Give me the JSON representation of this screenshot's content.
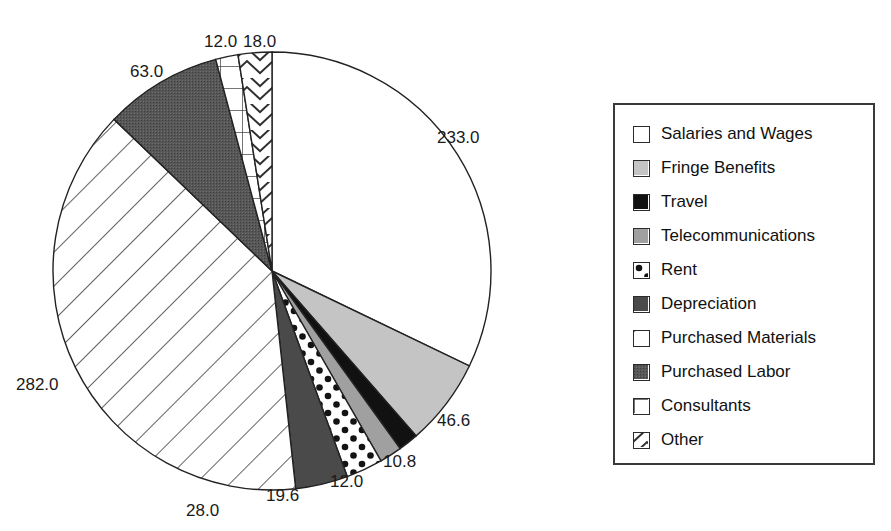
{
  "chart_data": {
    "type": "pie",
    "title": "",
    "subtitle": "",
    "xlabel": "",
    "ylabel": "",
    "legend_position": "right",
    "grid": false,
    "total": 725.0,
    "start_angle_deg": 0,
    "direction": "clockwise",
    "categories": [
      "Salaries and Wages",
      "Fringe Benefits",
      "Travel",
      "Telecommunications",
      "Rent",
      "Depreciation",
      "Purchased Materials",
      "Purchased Labor",
      "Consultants",
      "Other"
    ],
    "values": [
      233.0,
      46.6,
      10.8,
      12.0,
      19.6,
      28.0,
      282.0,
      63.0,
      12.0,
      18.0
    ],
    "data_labels": [
      "233.0",
      "46.6",
      "10.8",
      "12.0",
      "19.6",
      "28.0",
      "282.0",
      "63.0",
      "12.0",
      "18.0"
    ],
    "slices": [
      {
        "label": "Salaries and Wages",
        "value": 233.0,
        "data_label": "233.0",
        "fill": "white",
        "color": "#ffffff"
      },
      {
        "label": "Fringe Benefits",
        "value": 46.6,
        "data_label": "46.6",
        "fill": "light-gray",
        "color": "#c4c4c4"
      },
      {
        "label": "Travel",
        "value": 10.8,
        "data_label": "10.8",
        "fill": "black",
        "color": "#111111"
      },
      {
        "label": "Telecommunications",
        "value": 12.0,
        "data_label": "12.0",
        "fill": "medium-gray",
        "color": "#a0a0a0"
      },
      {
        "label": "Rent",
        "value": 19.6,
        "data_label": "19.6",
        "fill": "dots",
        "color": "#ffffff"
      },
      {
        "label": "Depreciation",
        "value": 28.0,
        "data_label": "28.0",
        "fill": "dark-gray",
        "color": "#4a4a4a"
      },
      {
        "label": "Purchased Materials",
        "value": 282.0,
        "data_label": "282.0",
        "fill": "diagonal-hatch",
        "color": "#ffffff"
      },
      {
        "label": "Purchased Labor",
        "value": 63.0,
        "data_label": "63.0",
        "fill": "stipple-dark",
        "color": "#555555"
      },
      {
        "label": "Consultants",
        "value": 12.0,
        "data_label": "12.0",
        "fill": "grid",
        "color": "#ffffff"
      },
      {
        "label": "Other",
        "value": 18.0,
        "data_label": "18.0",
        "fill": "chevron",
        "color": "#ffffff"
      }
    ]
  },
  "legend": {
    "items": [
      {
        "label": "Salaries and Wages",
        "fill": "white"
      },
      {
        "label": "Fringe Benefits",
        "fill": "light-gray"
      },
      {
        "label": "Travel",
        "fill": "black"
      },
      {
        "label": "Telecommunications",
        "fill": "medium-gray"
      },
      {
        "label": "Rent",
        "fill": "dots"
      },
      {
        "label": "Depreciation",
        "fill": "dark-gray"
      },
      {
        "label": "Purchased Materials",
        "fill": "diagonal-hatch"
      },
      {
        "label": "Purchased Labor",
        "fill": "stipple-dark"
      },
      {
        "label": "Consultants",
        "fill": "grid"
      },
      {
        "label": "Other",
        "fill": "chevron"
      }
    ]
  },
  "geometry": {
    "center_x": 272,
    "center_y": 271,
    "radius": 219
  },
  "labels": [
    {
      "text": "233.0",
      "x": 437,
      "y": 128
    },
    {
      "text": "46.6",
      "x": 437,
      "y": 411
    },
    {
      "text": "10.8",
      "x": 383,
      "y": 452
    },
    {
      "text": "12.0",
      "x": 330,
      "y": 472
    },
    {
      "text": "19.6",
      "x": 266,
      "y": 486
    },
    {
      "text": "28.0",
      "x": 186,
      "y": 501
    },
    {
      "text": "282.0",
      "x": 16,
      "y": 375
    },
    {
      "text": "63.0",
      "x": 130,
      "y": 62
    },
    {
      "text": "12.0",
      "x": 204,
      "y": 32
    },
    {
      "text": "18.0",
      "x": 243,
      "y": 32
    }
  ]
}
